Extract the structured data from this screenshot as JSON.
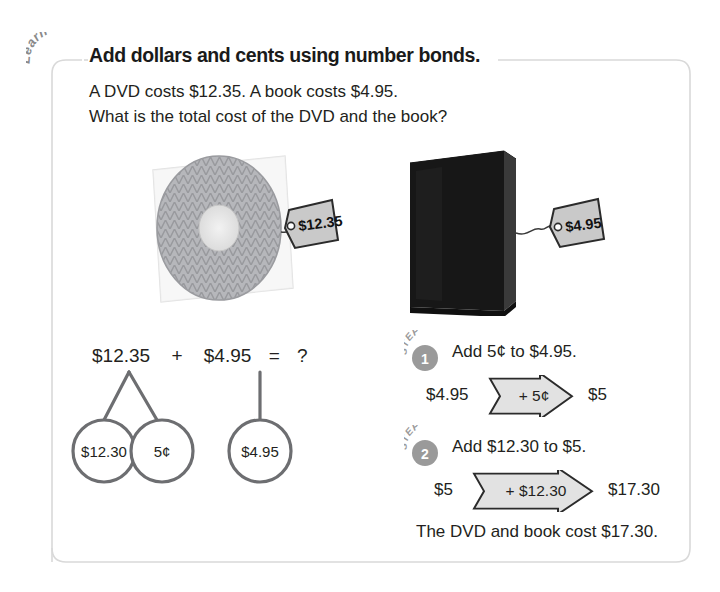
{
  "lesson": {
    "badge_label": "Learn",
    "title": "Add dollars and cents using number bonds.",
    "prompt_line_1": "A DVD costs $12.35. A book costs $4.95.",
    "prompt_line_2": "What is the total cost of the DVD and the book?"
  },
  "items": [
    {
      "name": "dvd",
      "alt": "dvd-in-sleeve",
      "price_tag": "$12.35"
    },
    {
      "name": "book",
      "alt": "black-hardcover-book",
      "price_tag": "$4.95"
    }
  ],
  "number_bond": {
    "equation": {
      "left_addend": "$12.35",
      "plus": "+",
      "right_addend": "$4.95",
      "equals": "=",
      "result": "?"
    },
    "parts": [
      {
        "label": "$12.30"
      },
      {
        "label": "5¢"
      },
      {
        "label": "$4.95"
      }
    ]
  },
  "steps": [
    {
      "step_word": "STEP",
      "number": "1",
      "instruction": "Add 5¢ to $4.95.",
      "from": "$4.95",
      "operation": "+ 5¢",
      "to": "$5"
    },
    {
      "step_word": "STEP",
      "number": "2",
      "instruction": "Add $12.30 to $5.",
      "from": "$5",
      "operation": "+ $12.30",
      "to": "$17.30"
    }
  ],
  "conclusion": "The DVD and book cost $17.30.",
  "colors": {
    "text": "#231f20",
    "frame": "#d8d8d8",
    "bond_stroke": "#6d6e71",
    "badge_gray": "#9a9a9a",
    "tag_fill": "#c9c9c9",
    "arrow_fill": "#e2e2e2",
    "book_black": "#171717"
  }
}
